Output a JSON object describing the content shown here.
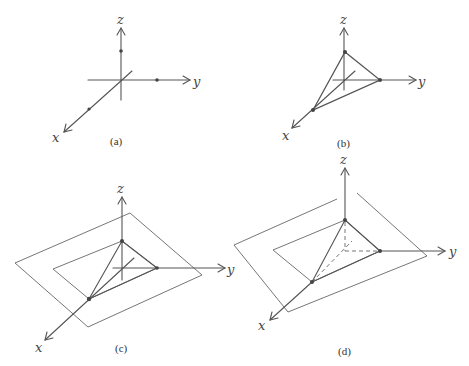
{
  "figure": {
    "panels": [
      {
        "id": "a",
        "caption": "(a)",
        "axes": {
          "x": "x",
          "y": "y",
          "z": "z"
        },
        "description": "Coordinate axes with intercept points marked on x, y, z axes"
      },
      {
        "id": "b",
        "caption": "(b)",
        "axes": {
          "x": "x",
          "y": "y",
          "z": "z"
        },
        "description": "Triangle connecting the three intercept points"
      },
      {
        "id": "c",
        "caption": "(c)",
        "axes": {
          "x": "x",
          "y": "y",
          "z": "z"
        },
        "description": "Plane drawn through the triangle, shown as nested parallelograms"
      },
      {
        "id": "d",
        "caption": "(d)",
        "axes": {
          "x": "x",
          "y": "y",
          "z": "z"
        },
        "description": "Plane with hidden axis segments shown dashed"
      }
    ]
  }
}
